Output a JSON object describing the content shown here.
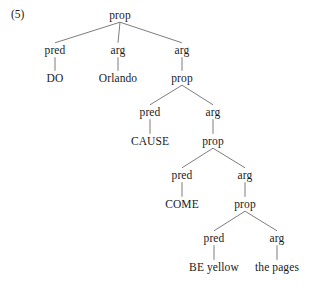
{
  "figure": {
    "example_number": "(5)",
    "line_color": "#6e6e6e",
    "text_color": "#1a1a1a",
    "background_color": "#ffffff"
  },
  "tree": {
    "nodes": [
      {
        "id": "n0",
        "label": "prop",
        "x": 120,
        "y": 16
      },
      {
        "id": "n1",
        "label": "pred",
        "x": 55,
        "y": 51
      },
      {
        "id": "n2",
        "label": "arg",
        "x": 118,
        "y": 51
      },
      {
        "id": "n3",
        "label": "arg",
        "x": 182,
        "y": 51
      },
      {
        "id": "n4",
        "label": "DO",
        "x": 55,
        "y": 79
      },
      {
        "id": "n5",
        "label": "Orlando",
        "x": 118,
        "y": 79
      },
      {
        "id": "n6",
        "label": "prop",
        "x": 182,
        "y": 79
      },
      {
        "id": "n7",
        "label": "pred",
        "x": 150,
        "y": 113
      },
      {
        "id": "n8",
        "label": "arg",
        "x": 213,
        "y": 113
      },
      {
        "id": "n9",
        "label": "CAUSE",
        "x": 150,
        "y": 142
      },
      {
        "id": "n10",
        "label": "prop",
        "x": 213,
        "y": 142
      },
      {
        "id": "n11",
        "label": "pred",
        "x": 182,
        "y": 176
      },
      {
        "id": "n12",
        "label": "arg",
        "x": 245,
        "y": 176
      },
      {
        "id": "n13",
        "label": "COME",
        "x": 182,
        "y": 205
      },
      {
        "id": "n14",
        "label": "prop",
        "x": 245,
        "y": 205
      },
      {
        "id": "n15",
        "label": "pred",
        "x": 214,
        "y": 239
      },
      {
        "id": "n16",
        "label": "arg",
        "x": 277,
        "y": 239
      },
      {
        "id": "n17",
        "label": "BE yellow",
        "x": 214,
        "y": 268
      },
      {
        "id": "n18",
        "label": "the pages",
        "x": 277,
        "y": 268
      }
    ],
    "edges": [
      {
        "from": "n0",
        "to": "n1"
      },
      {
        "from": "n0",
        "to": "n2"
      },
      {
        "from": "n0",
        "to": "n3"
      },
      {
        "from": "n1",
        "to": "n4"
      },
      {
        "from": "n2",
        "to": "n5"
      },
      {
        "from": "n3",
        "to": "n6"
      },
      {
        "from": "n6",
        "to": "n7"
      },
      {
        "from": "n6",
        "to": "n8"
      },
      {
        "from": "n7",
        "to": "n9"
      },
      {
        "from": "n8",
        "to": "n10"
      },
      {
        "from": "n10",
        "to": "n11"
      },
      {
        "from": "n10",
        "to": "n12"
      },
      {
        "from": "n11",
        "to": "n13"
      },
      {
        "from": "n12",
        "to": "n14"
      },
      {
        "from": "n14",
        "to": "n15"
      },
      {
        "from": "n14",
        "to": "n16"
      },
      {
        "from": "n15",
        "to": "n17"
      },
      {
        "from": "n16",
        "to": "n18"
      }
    ]
  }
}
